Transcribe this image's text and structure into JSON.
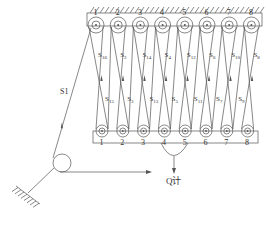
{
  "diagram": {
    "title": "",
    "top_block": {
      "sheave_numbers": [
        "1",
        "2",
        "3",
        "4",
        "5",
        "6",
        "7",
        "8"
      ]
    },
    "bottom_block": {
      "sheave_numbers": [
        "1",
        "2",
        "3",
        "4",
        "5",
        "6",
        "7",
        "8"
      ]
    },
    "upper_rope_labels": [
      "S16",
      "S2",
      "S14",
      "S4",
      "S12",
      "S6",
      "S10",
      "S8"
    ],
    "lower_rope_labels": [
      "S15",
      "S3",
      "S13",
      "S5",
      "S11",
      "S7",
      "S9"
    ],
    "lead_rope_label": "S1",
    "load_label": "Q计",
    "colors": {
      "line": "#555555",
      "text": "#333333"
    }
  }
}
